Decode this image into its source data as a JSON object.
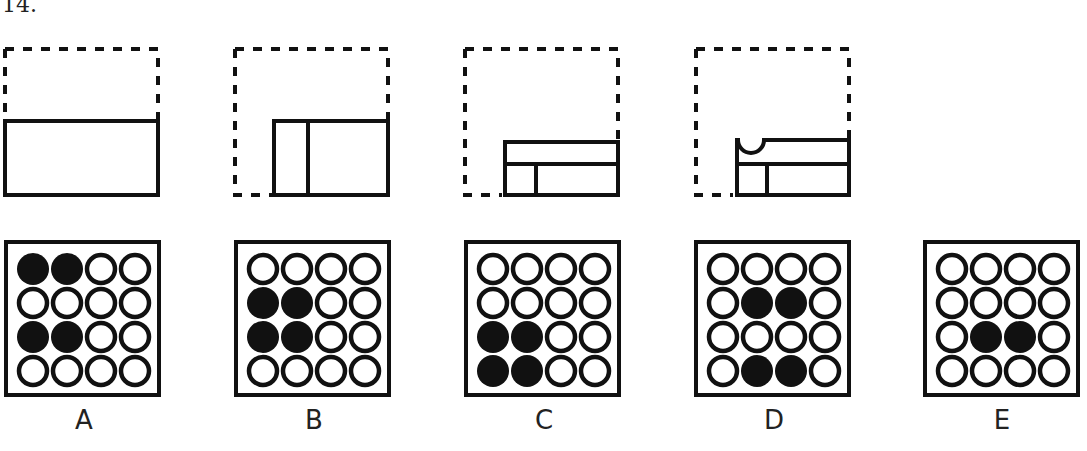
{
  "question": {
    "number": "14."
  },
  "sequence": [
    {
      "id": "step-1",
      "stage": "unfolded",
      "note": "solid rectangle in lower half of dashed square"
    },
    {
      "id": "step-2",
      "stage": "folded-left",
      "note": "rectangle with vertical crease"
    },
    {
      "id": "step-3",
      "stage": "folded-up",
      "note": "rectangle with horizontal and vertical creases"
    },
    {
      "id": "step-4",
      "stage": "punched",
      "note": "semicircle hole punched at top-left edge"
    }
  ],
  "options": [
    {
      "label": "A",
      "filled": [
        [
          0,
          0
        ],
        [
          0,
          1
        ],
        [
          2,
          0
        ],
        [
          2,
          1
        ]
      ]
    },
    {
      "label": "B",
      "filled": [
        [
          1,
          0
        ],
        [
          1,
          1
        ],
        [
          2,
          0
        ],
        [
          2,
          1
        ]
      ]
    },
    {
      "label": "C",
      "filled": [
        [
          2,
          0
        ],
        [
          2,
          1
        ],
        [
          3,
          0
        ],
        [
          3,
          1
        ]
      ]
    },
    {
      "label": "D",
      "filled": [
        [
          1,
          1
        ],
        [
          1,
          2
        ],
        [
          3,
          1
        ],
        [
          3,
          2
        ]
      ]
    },
    {
      "label": "E",
      "filled": [
        [
          2,
          1
        ],
        [
          2,
          2
        ]
      ]
    }
  ],
  "colors": {
    "ink": "#111111",
    "background": "#ffffff"
  }
}
